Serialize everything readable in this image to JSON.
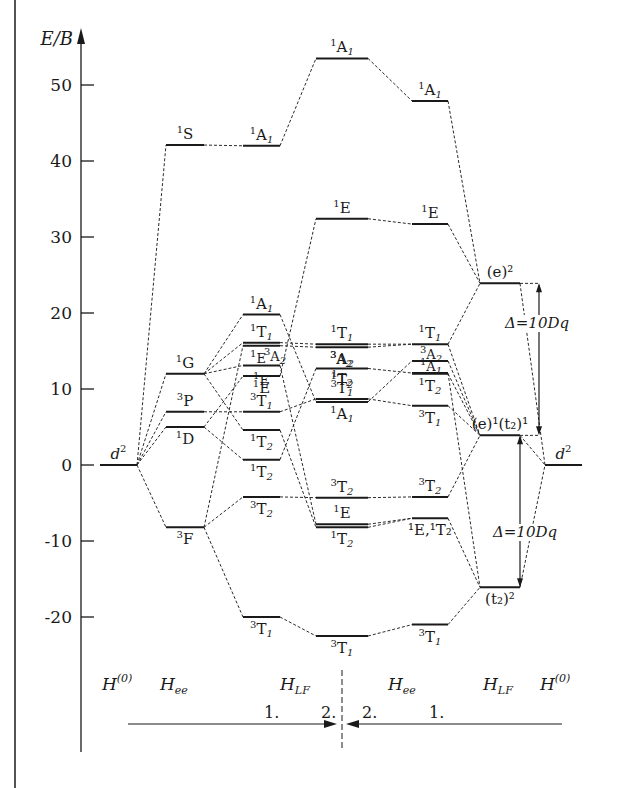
{
  "page": {
    "frame_left_border": true,
    "top_text_cut_off": true
  },
  "axis": {
    "label": "E/B",
    "ticks": [
      50,
      40,
      30,
      20,
      10,
      0,
      -10,
      -20
    ],
    "tick_labels": [
      "50",
      "40",
      "30",
      "20",
      "10",
      "0",
      "-10",
      "-20"
    ]
  },
  "columns": [
    {
      "id": "free-ion",
      "x1": 100,
      "x2": 137
    },
    {
      "id": "hee-1",
      "x1": 166,
      "x2": 204
    },
    {
      "id": "hlf-1",
      "x1": 243,
      "x2": 280
    },
    {
      "id": "hlf-2",
      "x1": 316,
      "x2": 368
    },
    {
      "id": "hee-2",
      "x1": 412,
      "x2": 448
    },
    {
      "id": "strong-field",
      "x1": 480,
      "x2": 520
    },
    {
      "id": "free-ion-right",
      "x1": 545,
      "x2": 582
    }
  ],
  "levels": [
    {
      "id": "c1-d2",
      "col": 0,
      "E": 0,
      "label": "d",
      "sup": "2",
      "pos": "above"
    },
    {
      "id": "c2-1S",
      "col": 1,
      "E": 42.1,
      "pre": "1",
      "label": "S",
      "pos": "above"
    },
    {
      "id": "c2-1G",
      "col": 1,
      "E": 12,
      "pre": "1",
      "label": "G",
      "pos": "above"
    },
    {
      "id": "c2-3P",
      "col": 1,
      "E": 7,
      "pre": "3",
      "label": "P",
      "pos": "above"
    },
    {
      "id": "c2-1D",
      "col": 1,
      "E": 5,
      "pre": "1",
      "label": "D",
      "pos": "below"
    },
    {
      "id": "c2-3F",
      "col": 1,
      "E": -8.2,
      "pre": "3",
      "label": "F",
      "pos": "below"
    },
    {
      "id": "c3-1A1-high",
      "col": 2,
      "E": 42,
      "pre": "1",
      "label": "A",
      "sub": "1",
      "pos": "above"
    },
    {
      "id": "c3-1A1",
      "col": 2,
      "E": 19.8,
      "pre": "1",
      "label": "A",
      "sub": "1",
      "pos": "above"
    },
    {
      "id": "c3-1T1",
      "col": 2,
      "E": 16.1,
      "pre": "1",
      "label": "T",
      "sub": "1",
      "pos": "above"
    },
    {
      "id": "c3-3A2",
      "col": 2,
      "E": 15.7,
      "pre": "3",
      "label": "A",
      "sub": "2",
      "pos": "none"
    },
    {
      "id": "c3-1E",
      "col": 2,
      "E": 13.1,
      "pre": "1",
      "label": "E",
      "pos": "none"
    },
    {
      "id": "c3-1E-b",
      "col": 2,
      "E": 11.7,
      "pre": "1",
      "label": "E",
      "pos": "below"
    },
    {
      "id": "c3-3T1",
      "col": 2,
      "E": 7,
      "pre": "3",
      "label": "T",
      "sub": "1",
      "pos": "above"
    },
    {
      "id": "c3-1T2",
      "col": 2,
      "E": 4.6,
      "pre": "1",
      "label": "T",
      "sub": "2",
      "pos": "below"
    },
    {
      "id": "c3-1T2-b",
      "col": 2,
      "E": 0.7,
      "pre": "1",
      "label": "T",
      "sub": "2",
      "pos": "below"
    },
    {
      "id": "c3-3T2",
      "col": 2,
      "E": -4.2,
      "pre": "3",
      "label": "T",
      "sub": "2",
      "pos": "below"
    },
    {
      "id": "c3-3T1-low",
      "col": 2,
      "E": -20,
      "pre": "3",
      "label": "T",
      "sub": "1",
      "pos": "below"
    },
    {
      "id": "c4-1A1-top",
      "col": 3,
      "E": 53.5,
      "pre": "1",
      "label": "A",
      "sub": "1",
      "pos": "above"
    },
    {
      "id": "c4-1E",
      "col": 3,
      "E": 32.4,
      "pre": "1",
      "label": "E",
      "pos": "above"
    },
    {
      "id": "c4-1T1",
      "col": 3,
      "E": 15.9,
      "pre": "1",
      "label": "T",
      "sub": "1",
      "pos": "above"
    },
    {
      "id": "c4-3A2",
      "col": 3,
      "E": 15.5,
      "pre": "3",
      "label": "A",
      "sub": "2",
      "pos": "below"
    },
    {
      "id": "c4-1T2",
      "col": 3,
      "E": 12.7,
      "pre": "1",
      "label": "T",
      "sub": "2",
      "pos": "below"
    },
    {
      "id": "c4-3T1",
      "col": 3,
      "E": 8.7,
      "pre": "3",
      "label": "T",
      "sub": "1",
      "pos": "above"
    },
    {
      "id": "c4-1A1",
      "col": 3,
      "E": 8.3,
      "pre": "1",
      "label": "A",
      "sub": "1",
      "pos": "below"
    },
    {
      "id": "c4-3T2",
      "col": 3,
      "E": -4.3,
      "pre": "3",
      "label": "T",
      "sub": "2",
      "pos": "above"
    },
    {
      "id": "c4-1E-low",
      "col": 3,
      "E": -7.8,
      "pre": "1",
      "label": "E",
      "pos": "above"
    },
    {
      "id": "c4-1T2-low",
      "col": 3,
      "E": -8.2,
      "pre": "1",
      "label": "T",
      "sub": "2",
      "pos": "below"
    },
    {
      "id": "c4-3T1-low",
      "col": 3,
      "E": -22.5,
      "pre": "3",
      "label": "T",
      "sub": "1",
      "pos": "below"
    },
    {
      "id": "c5-1A1-top",
      "col": 4,
      "E": 47.9,
      "pre": "1",
      "label": "A",
      "sub": "1",
      "pos": "above"
    },
    {
      "id": "c5-1E",
      "col": 4,
      "E": 31.7,
      "pre": "1",
      "label": "E",
      "pos": "above"
    },
    {
      "id": "c5-1T1",
      "col": 4,
      "E": 15.9,
      "pre": "1",
      "label": "T",
      "sub": "1",
      "pos": "above"
    },
    {
      "id": "c5-3A2",
      "col": 4,
      "E": 13.7,
      "pre": "3",
      "label": "A",
      "sub": "2",
      "pos": "none"
    },
    {
      "id": "c5-1A1",
      "col": 4,
      "E": 12.1,
      "pre": "1",
      "label": "A",
      "sub": "1",
      "pos": "none"
    },
    {
      "id": "c5-1T2",
      "col": 4,
      "E": 12,
      "pre": "1",
      "label": "T",
      "sub": "2",
      "pos": "below"
    },
    {
      "id": "c5-3T1",
      "col": 4,
      "E": 7.8,
      "pre": "3",
      "label": "T",
      "sub": "1",
      "pos": "below"
    },
    {
      "id": "c5-3T2",
      "col": 4,
      "E": -4.2,
      "pre": "3",
      "label": "T",
      "sub": "2",
      "pos": "above"
    },
    {
      "id": "c5-1E1T2",
      "col": 4,
      "E": -7,
      "text": "¹E,¹T₂",
      "pos": "below"
    },
    {
      "id": "c5-3T1-low",
      "col": 4,
      "E": -21,
      "pre": "3",
      "label": "T",
      "sub": "1",
      "pos": "below"
    },
    {
      "id": "c6-e2",
      "col": 5,
      "E": 23.9,
      "text": "(e)²",
      "pos": "above"
    },
    {
      "id": "c6-e1t1",
      "col": 5,
      "E": 3.9,
      "text": "(e)¹(t₂)¹",
      "pos": "above"
    },
    {
      "id": "c6-t22",
      "col": 5,
      "E": -16.1,
      "text": "(t₂)²",
      "pos": "below"
    },
    {
      "id": "c7-d2",
      "col": 6,
      "E": 0,
      "label": "d",
      "sup": "2",
      "pos": "above"
    }
  ],
  "extra_labels": [
    {
      "text_pre": "1",
      "text": "E",
      "x": 258,
      "y": 363
    },
    {
      "text_pre": "3",
      "text": "A",
      "sub": "2",
      "x": 275,
      "y": 361
    },
    {
      "text_pre": "3",
      "text": "A",
      "sub": "2",
      "x": 341,
      "y": 364
    },
    {
      "text_pre": "1",
      "text": "T",
      "sub": "2",
      "x": 342,
      "y": 383
    },
    {
      "text_pre": "1",
      "text": "E",
      "x": 261,
      "y": 385
    },
    {
      "text_pre": "3",
      "text": "A",
      "sub": "2",
      "x": 431,
      "y": 359
    },
    {
      "text_pre": "1",
      "text": "A",
      "sub": "1",
      "x": 431,
      "y": 371
    }
  ],
  "connections": [
    [
      "c1-d2",
      "c2-1S"
    ],
    [
      "c1-d2",
      "c2-1G"
    ],
    [
      "c1-d2",
      "c2-3P"
    ],
    [
      "c1-d2",
      "c2-1D"
    ],
    [
      "c1-d2",
      "c2-3F"
    ],
    [
      "c2-1S",
      "c3-1A1-high"
    ],
    [
      "c2-1G",
      "c3-1A1"
    ],
    [
      "c2-1G",
      "c3-1T1"
    ],
    [
      "c2-1G",
      "c3-1E"
    ],
    [
      "c2-1G",
      "c3-1T2"
    ],
    [
      "c2-3P",
      "c3-3T1"
    ],
    [
      "c2-1D",
      "c3-1E-b"
    ],
    [
      "c2-1D",
      "c3-1T2-b"
    ],
    [
      "c2-3F",
      "c3-3A2"
    ],
    [
      "c2-3F",
      "c3-3T2"
    ],
    [
      "c2-3F",
      "c3-3T1-low"
    ],
    [
      "c3-1A1-high",
      "c4-1A1-top"
    ],
    [
      "c3-1A1",
      "c4-1A1"
    ],
    [
      "c3-1T1",
      "c4-1T1"
    ],
    [
      "c3-3A2",
      "c4-3A2"
    ],
    [
      "c3-1E",
      "c4-1E-low"
    ],
    [
      "c3-1E-b",
      "c4-1E"
    ],
    [
      "c3-3T1",
      "c4-3T1"
    ],
    [
      "c3-1T2",
      "c4-1T2-low"
    ],
    [
      "c3-1T2-b",
      "c4-1T2"
    ],
    [
      "c3-3T2",
      "c4-3T2"
    ],
    [
      "c3-3T1-low",
      "c4-3T1-low"
    ],
    [
      "c4-1A1-top",
      "c5-1A1-top"
    ],
    [
      "c4-1E",
      "c5-1E"
    ],
    [
      "c4-1T1",
      "c5-1T1"
    ],
    [
      "c4-3A2",
      "c5-1T1"
    ],
    [
      "c4-1T2",
      "c5-1A1"
    ],
    [
      "c4-3T1",
      "c5-3T1"
    ],
    [
      "c4-1A1",
      "c5-3A2"
    ],
    [
      "c4-3T2",
      "c5-3T2"
    ],
    [
      "c4-1E-low",
      "c5-1E1T2"
    ],
    [
      "c4-1T2-low",
      "c5-1E1T2"
    ],
    [
      "c4-3T1-low",
      "c5-3T1-low"
    ],
    [
      "c5-1A1-top",
      "c6-e2"
    ],
    [
      "c5-1E",
      "c6-e2"
    ],
    [
      "c5-1T1",
      "c6-e2"
    ],
    [
      "c5-1T1",
      "c6-e1t1"
    ],
    [
      "c5-3A2",
      "c6-e1t1"
    ],
    [
      "c5-1A1",
      "c6-t22"
    ],
    [
      "c5-1T2",
      "c6-e1t1"
    ],
    [
      "c5-3T1",
      "c6-e1t1"
    ],
    [
      "c5-3T2",
      "c6-e1t1"
    ],
    [
      "c5-1E1T2",
      "c6-t22"
    ],
    [
      "c5-3T1-low",
      "c6-t22"
    ],
    [
      "c6-e2",
      "c7-d2"
    ],
    [
      "c6-e1t1",
      "c7-d2"
    ],
    [
      "c6-t22",
      "c7-d2"
    ]
  ],
  "splittings": [
    {
      "id": "delta-upper",
      "label": "Δ=10Dq",
      "x": 539,
      "from_E": 23.9,
      "to_E": 3.9,
      "label_x": 537,
      "label_y": 328
    },
    {
      "id": "delta-lower",
      "label": "Δ=10Dq",
      "x": 520,
      "from_E": 3.9,
      "to_E": -16.1,
      "label_x": 525,
      "label_y": 537
    }
  ],
  "hamiltonians": [
    {
      "id": "h0-left",
      "base": "H",
      "sup": "(0)",
      "x": 102,
      "y": 690
    },
    {
      "id": "hee-left",
      "base": "H",
      "sub": "ee",
      "x": 160,
      "y": 690
    },
    {
      "id": "hlf-left",
      "base": "H",
      "sub": "LF",
      "x": 280,
      "y": 690
    },
    {
      "id": "hee-right",
      "base": "H",
      "sub": "ee",
      "x": 388,
      "y": 690
    },
    {
      "id": "hlf-right",
      "base": "H",
      "sub": "LF",
      "x": 483,
      "y": 690
    },
    {
      "id": "h0-right",
      "base": "H",
      "sup": "(0)",
      "x": 540,
      "y": 690
    }
  ],
  "steps": [
    {
      "label": "1.",
      "x": 264,
      "y": 718
    },
    {
      "label": "2.",
      "x": 321,
      "y": 718
    },
    {
      "label": "2.",
      "x": 362,
      "y": 718
    },
    {
      "label": "1.",
      "x": 429,
      "y": 718
    }
  ],
  "flow": {
    "left_arrow": {
      "x1": 128,
      "x2": 337,
      "y": 724
    },
    "right_arrow": {
      "x1": 562,
      "x2": 346,
      "y": 724
    },
    "divider": {
      "x": 342,
      "y1": 670,
      "y2": 790
    }
  }
}
